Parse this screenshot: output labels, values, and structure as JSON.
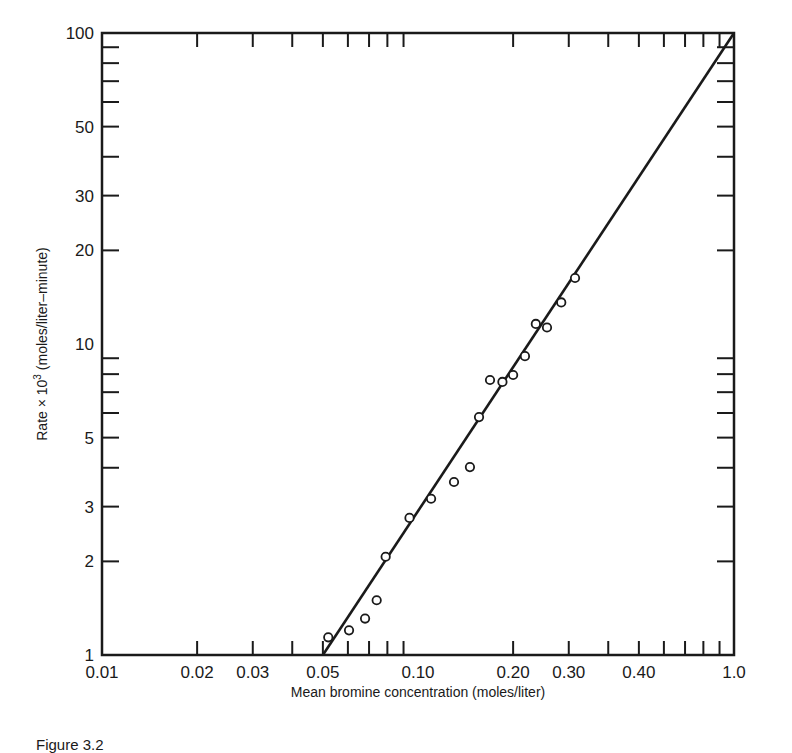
{
  "chart_data": {
    "type": "scatter",
    "title": "",
    "xlabel": "Mean bromine concentration (moles/liter)",
    "ylabel": "Rate × 10³ (moles/liter–minute)",
    "xscale": "log",
    "yscale": "log",
    "xlim": [
      0.01,
      1.0
    ],
    "ylim": [
      1,
      100
    ],
    "grid": false,
    "legend": null,
    "x_tick_labels": [
      {
        "label": "0.01",
        "at": 0.01
      },
      {
        "label": "0.02",
        "at": 0.02
      },
      {
        "label": "0.03",
        "at": 0.03
      },
      {
        "label": "0.05",
        "at": 0.05
      },
      {
        "label": "0.10",
        "at": 0.1
      },
      {
        "label": "0.20",
        "at": 0.2
      },
      {
        "label": "0.30",
        "at": 0.3
      },
      {
        "label": "0.40",
        "at": 0.5
      },
      {
        "label": "1.0",
        "at": 1.0
      }
    ],
    "x_minor_ticks": [
      0.02,
      0.03,
      0.04,
      0.05,
      0.06,
      0.07,
      0.08,
      0.09,
      0.2,
      0.3,
      0.4,
      0.5,
      0.6,
      0.7,
      0.8,
      0.9
    ],
    "y_tick_labels": [
      {
        "label": "1",
        "at": 1
      },
      {
        "label": "2",
        "at": 2
      },
      {
        "label": "3",
        "at": 3
      },
      {
        "label": "5",
        "at": 5
      },
      {
        "label": "10",
        "at": 10
      },
      {
        "label": "20",
        "at": 20
      },
      {
        "label": "30",
        "at": 30
      },
      {
        "label": "50",
        "at": 50
      },
      {
        "label": "100",
        "at": 100
      }
    ],
    "y_minor_ticks": [
      2,
      3,
      4,
      5,
      6,
      7,
      8,
      9,
      20,
      30,
      40,
      50,
      60,
      70,
      80,
      90
    ],
    "series": [
      {
        "name": "observed",
        "marker": "open-circle",
        "points": [
          {
            "x": 0.052,
            "y": 1.14
          },
          {
            "x": 0.0605,
            "y": 1.2
          },
          {
            "x": 0.068,
            "y": 1.31
          },
          {
            "x": 0.074,
            "y": 1.5
          },
          {
            "x": 0.079,
            "y": 2.07
          },
          {
            "x": 0.094,
            "y": 2.76
          },
          {
            "x": 0.11,
            "y": 3.18
          },
          {
            "x": 0.13,
            "y": 3.6
          },
          {
            "x": 0.146,
            "y": 4.02
          },
          {
            "x": 0.156,
            "y": 5.82
          },
          {
            "x": 0.169,
            "y": 7.66
          },
          {
            "x": 0.185,
            "y": 7.55
          },
          {
            "x": 0.2,
            "y": 7.95
          },
          {
            "x": 0.218,
            "y": 9.14
          },
          {
            "x": 0.236,
            "y": 11.6
          },
          {
            "x": 0.256,
            "y": 11.3
          },
          {
            "x": 0.284,
            "y": 13.6
          },
          {
            "x": 0.314,
            "y": 16.3
          }
        ]
      },
      {
        "name": "fit line",
        "type": "line",
        "points": [
          {
            "x": 0.05,
            "y": 1
          },
          {
            "x": 1.0,
            "y": 100
          }
        ]
      }
    ]
  },
  "caption": "Figure 3.2"
}
